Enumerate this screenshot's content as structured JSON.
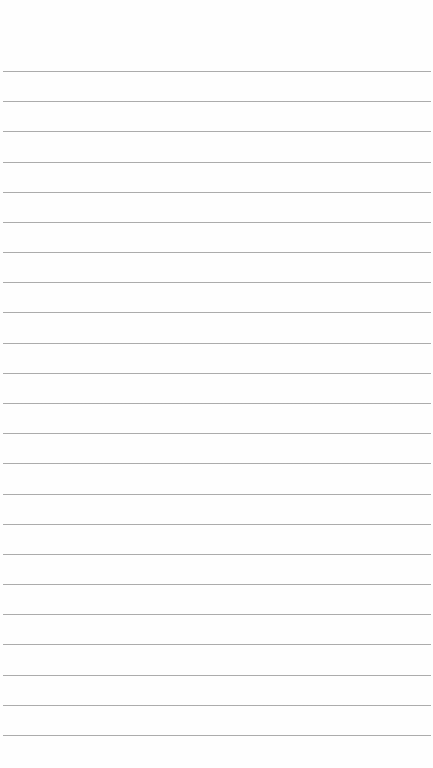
{
  "document": {
    "type": "lined-paper",
    "text_content": "",
    "ruled_line_count": 23,
    "line_color": "#8a8a8a",
    "paper_color": "#fefefe"
  }
}
